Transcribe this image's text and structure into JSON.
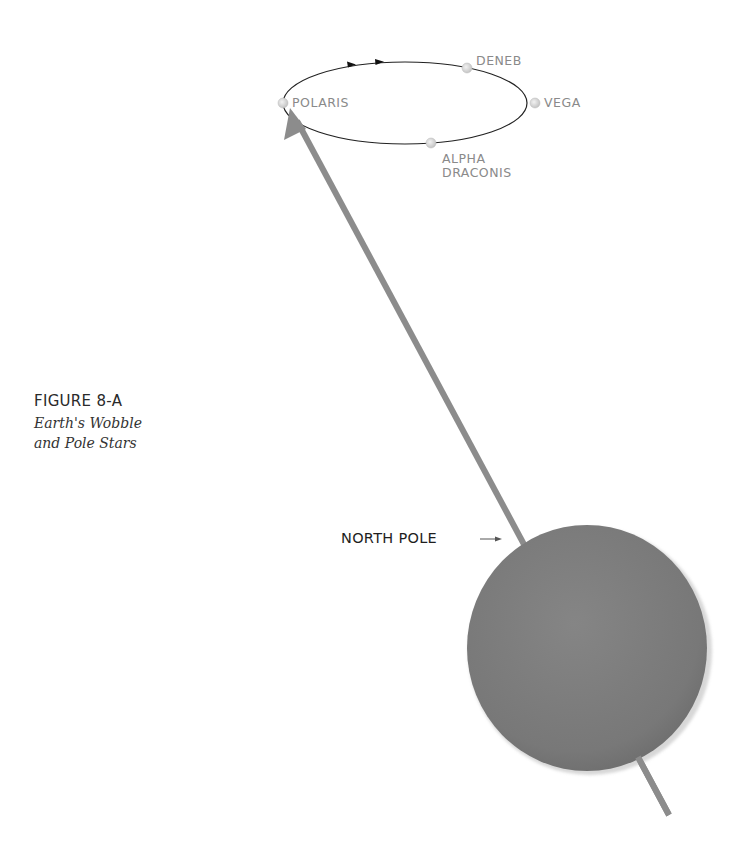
{
  "figure": {
    "number": "FIGURE 8-A",
    "caption_line1": "Earth's Wobble",
    "caption_line2": "and Pole Stars"
  },
  "orbit": {
    "center": [
      405,
      103
    ],
    "rx": 122,
    "ry": 41,
    "direction": "clockwise (arrows along top edge pointing right)"
  },
  "stars": [
    {
      "name": "POLARIS",
      "position": [
        283,
        103
      ]
    },
    {
      "name": "DENEB",
      "position": [
        467,
        68
      ]
    },
    {
      "name": "VEGA",
      "position": [
        535,
        103
      ]
    },
    {
      "name": "ALPHA DRACONIS",
      "line1": "ALPHA",
      "line2": "DRACONIS",
      "position": [
        431,
        143
      ]
    }
  ],
  "earth": {
    "center": [
      587,
      648
    ],
    "radius": 121,
    "color": "#7a7a7a"
  },
  "axis": {
    "start": [
      669,
      815
    ],
    "end": [
      291,
      110
    ],
    "color": "#8c8c8c"
  },
  "labels": {
    "north_pole": "NORTH POLE",
    "north_pole_arrow": "→"
  },
  "colors": {
    "star_dot": "#d8d8d8",
    "orbit_line": "#222222",
    "label_gray": "#8a8a8a"
  }
}
